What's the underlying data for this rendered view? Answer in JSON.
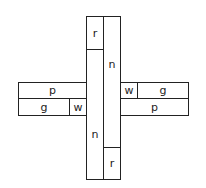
{
  "diagram": {
    "line_color": "#222222",
    "cells": [
      {
        "id": "top-r",
        "label": "r",
        "x": 86,
        "y": 16,
        "w": 18,
        "h": 34
      },
      {
        "id": "left-n",
        "label": "n",
        "x": 86,
        "y": 49,
        "w": 18,
        "h": 131
      },
      {
        "id": "right-n",
        "label": "n",
        "x": 103,
        "y": 16,
        "w": 18,
        "h": 132
      },
      {
        "id": "bottom-r",
        "label": "r",
        "x": 103,
        "y": 147,
        "w": 18,
        "h": 33
      },
      {
        "id": "left-p",
        "label": "p",
        "x": 18,
        "y": 82,
        "w": 69,
        "h": 17
      },
      {
        "id": "left-g",
        "label": "g",
        "x": 18,
        "y": 98,
        "w": 52,
        "h": 18
      },
      {
        "id": "left-w",
        "label": "w",
        "x": 69,
        "y": 98,
        "w": 18,
        "h": 18
      },
      {
        "id": "right-w",
        "label": "w",
        "x": 120,
        "y": 82,
        "w": 18,
        "h": 17
      },
      {
        "id": "right-g",
        "label": "g",
        "x": 137,
        "y": 82,
        "w": 52,
        "h": 17
      },
      {
        "id": "right-p",
        "label": "p",
        "x": 120,
        "y": 98,
        "w": 69,
        "h": 18
      }
    ],
    "label_positions": {
      "left-n": {
        "dy": 20
      },
      "right-n": {
        "dy": -18
      }
    }
  }
}
